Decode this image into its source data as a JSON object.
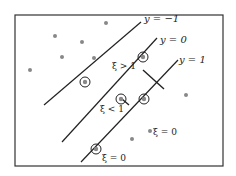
{
  "diagram": {
    "labels": {
      "line_neg": "y = −1",
      "line_zero": "y = 0",
      "line_pos": "y = 1",
      "xi_gt1": "ξ > 1",
      "xi_lt1": "ξ < 1",
      "xi_eq0_bottom": "ξ = 0",
      "xi_eq0_right": "ξ = 0"
    },
    "colors": {
      "line": "#222222",
      "point": "#888888",
      "frame": "#333333"
    }
  }
}
